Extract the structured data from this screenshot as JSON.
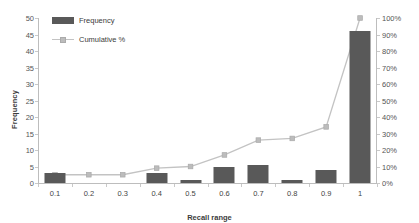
{
  "chart_data": {
    "type": "bar",
    "title": "",
    "xlabel": "Recall range",
    "ylabel": "Frequency",
    "y2label": "",
    "categories": [
      "0.1",
      "0.2",
      "0.3",
      "0.4",
      "0.5",
      "0.6",
      "0.7",
      "0.8",
      "0.9",
      "1"
    ],
    "ylim": [
      0,
      50
    ],
    "y2lim": [
      0,
      100
    ],
    "yticks": [
      "0",
      "5",
      "10",
      "15",
      "20",
      "25",
      "30",
      "35",
      "40",
      "45",
      "50"
    ],
    "y2ticks": [
      "0%",
      "10%",
      "20%",
      "30%",
      "40%",
      "50%",
      "60%",
      "70%",
      "80%",
      "90%",
      "100%"
    ],
    "grid": false,
    "legend_position": "top-left",
    "series": [
      {
        "name": "Frequency",
        "type": "bar",
        "axis": "left",
        "color": "#595959",
        "values": [
          3,
          0,
          0,
          3,
          1,
          5,
          5.5,
          1,
          4,
          46
        ]
      },
      {
        "name": "Cumulative %",
        "type": "line",
        "axis": "right",
        "color": "#c3c3c3",
        "marker_color": "#bcbcbc",
        "values": [
          5,
          5,
          5,
          9,
          10,
          17,
          26,
          27,
          34,
          100
        ]
      }
    ]
  },
  "legend": {
    "items": [
      {
        "label": "Frequency",
        "kind": "bar"
      },
      {
        "label": "Cumulative %",
        "kind": "line"
      }
    ]
  },
  "axes": {
    "x_title": "Recall range",
    "y_title": "Frequency"
  },
  "colors": {
    "bar": "#595959",
    "line": "#c3c3c3",
    "axis": "#bdbdbd",
    "text": "#444444",
    "background": "#ffffff"
  }
}
